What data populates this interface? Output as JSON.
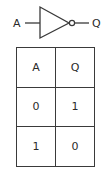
{
  "diagram": {
    "gate_type": "NOT",
    "input_label": "A",
    "output_label": "Q",
    "stroke_color": "#3a3a3a"
  },
  "truth_table": {
    "headers": [
      "A",
      "Q"
    ],
    "rows": [
      [
        "0",
        "1"
      ],
      [
        "1",
        "0"
      ]
    ]
  }
}
